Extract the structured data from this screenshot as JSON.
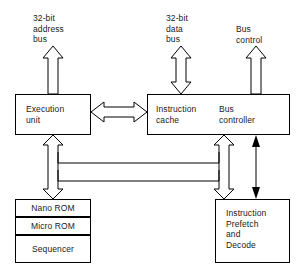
{
  "diagram": {
    "external_buses": [
      {
        "id": "address-bus",
        "label": "32-bit\naddress\nbus",
        "arrow": "up",
        "style": "hollow"
      },
      {
        "id": "data-bus",
        "label": "32-bit\ndata\nbus",
        "arrow": "bidirectional-vertical",
        "style": "hollow"
      },
      {
        "id": "bus-control",
        "label": "Bus\ncontrol",
        "arrow": "up",
        "style": "hollow"
      }
    ],
    "blocks": [
      {
        "id": "execution-unit",
        "label": "Execution\nunit"
      },
      {
        "id": "instruction-cache",
        "label": "Instruction\ncache"
      },
      {
        "id": "bus-controller",
        "label": "Bus\ncontroller"
      },
      {
        "id": "nano-rom",
        "label": "Nano ROM"
      },
      {
        "id": "micro-rom",
        "label": "Micro ROM"
      },
      {
        "id": "sequencer",
        "label": "Sequencer"
      },
      {
        "id": "instruction-prefetch-decode",
        "label": "Instruction\nPrefetch\nand\nDecode"
      }
    ],
    "connections": [
      {
        "id": "exec-to-cache",
        "from": "execution-unit",
        "to": "instruction-cache",
        "arrow": "bidirectional-horizontal",
        "style": "hollow"
      },
      {
        "id": "exec-to-control-store",
        "from": "execution-unit",
        "to": "nano-rom",
        "arrow": "bidirectional-vertical",
        "style": "hollow"
      },
      {
        "id": "cache-to-prefetch",
        "from": "instruction-cache",
        "to": "instruction-prefetch-decode",
        "arrow": "bidirectional-vertical",
        "style": "hollow"
      },
      {
        "id": "internal-bus-upper",
        "from": "exec-to-control-store",
        "to": "cache-to-prefetch",
        "arrow": "none",
        "style": "line"
      },
      {
        "id": "internal-bus-lower",
        "from": "exec-to-control-store",
        "to": "cache-to-prefetch",
        "arrow": "none",
        "style": "line"
      },
      {
        "id": "controller-to-prefetch",
        "from": "bus-controller",
        "to": "instruction-prefetch-decode",
        "arrow": "bidirectional-vertical",
        "style": "thin-solid"
      }
    ],
    "colors": {
      "line": "#000000",
      "fill": "#ffffff",
      "text": "#1a1a1a"
    }
  }
}
